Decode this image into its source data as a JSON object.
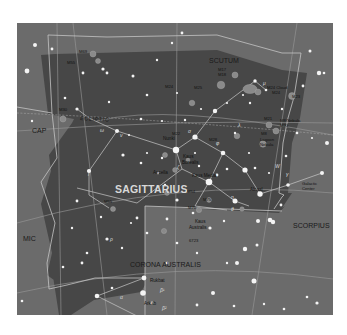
{
  "map": {
    "title": "Sagittarius star chart",
    "colors": {
      "sky_outer": "#6b6b6b",
      "sky_sagittarius": "#474747",
      "boundary_line": "#bdbdbd",
      "grid_line": "#9a9a9a",
      "constellation_line": "#c8c8c8",
      "star": "#f4f4f4",
      "deep_sky_object": "#8a8a8a",
      "label_dark": "#111111",
      "label_light": "#d8d8d8"
    },
    "constellations": [
      {
        "name": "SAGITTARIUS",
        "role": "main"
      },
      {
        "name": "SCUTUM",
        "role": "neighbor"
      },
      {
        "name": "SCORPIUS",
        "role": "neighbor"
      },
      {
        "name": "CORONA AUSTRALIS",
        "role": "neighbor"
      },
      {
        "name": "CAP",
        "role": "neighbor"
      },
      {
        "name": "MIC",
        "role": "neighbor"
      }
    ],
    "ecliptic_label": "ECLIPTIC",
    "star_names": [
      "Nunki",
      "Kaus Borealis",
      "Kaus Media",
      "Kaus Australis",
      "Alnasl",
      "Rukbat",
      "Arkab",
      "Ascella"
    ],
    "greek_labels": [
      "β¹",
      "β²",
      "λ",
      "φ",
      "σ",
      "τ",
      "ζ",
      "δ",
      "ε",
      "η",
      "γ",
      "θ",
      "ι",
      "μ",
      "ξ",
      "ο",
      "π",
      "ρ",
      "χ",
      "ω",
      "ν",
      "W",
      "α",
      "κ"
    ],
    "deep_sky_objects": [
      "M8",
      "M17",
      "M18",
      "M20",
      "M21",
      "M22",
      "M23",
      "M24",
      "M25",
      "M28",
      "M54",
      "M55",
      "M69",
      "M70",
      "M75",
      "M30"
    ],
    "annotations": [
      "Star Cloud M24",
      "Star Cloud M8",
      "Lagoon Nebula",
      "Galactic Center",
      "Small Sagittarius Star Cloud"
    ]
  }
}
